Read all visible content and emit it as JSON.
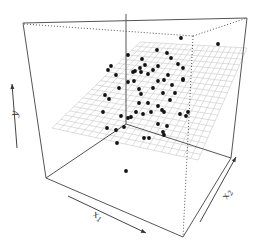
{
  "chart_data": {
    "type": "scatter",
    "subtype": "3d-scatter-with-regression-plane",
    "title": "",
    "xlabel": "x1",
    "ylabel": "y",
    "zlabel": "x2",
    "axis_labels": [
      {
        "base": "x",
        "sub": "1",
        "x": 92,
        "y": 216,
        "rotate": 28
      },
      {
        "base": "y",
        "sub": "",
        "x": 17,
        "y": 117,
        "rotate": -80
      },
      {
        "base": "x",
        "sub": "2",
        "x": 227,
        "y": 200,
        "rotate": -62
      }
    ],
    "grid": true,
    "box_color": "#555555",
    "grid_color": "#c8c8c8",
    "point_color": "#111111",
    "box": {
      "solid_lines": [
        [
          23,
          23,
          247,
          18
        ],
        [
          23,
          23,
          46,
          178
        ],
        [
          247,
          18,
          231,
          158
        ],
        [
          126,
          14,
          126,
          124
        ],
        [
          126,
          124,
          46,
          178
        ],
        [
          126,
          124,
          231,
          158
        ],
        [
          46,
          178,
          183,
          237
        ],
        [
          183,
          237,
          231,
          158
        ]
      ],
      "dotted_lines": [
        [
          24,
          24,
          193,
          36
        ],
        [
          193,
          36,
          247,
          18
        ],
        [
          193,
          36,
          183,
          237
        ]
      ]
    },
    "plane": {
      "corners": [
        [
          52,
          128
        ],
        [
          140,
          42
        ],
        [
          247,
          48
        ],
        [
          214,
          140
        ],
        [
          140,
          170
        ]
      ],
      "grid_quad": [
        [
          52,
          128
        ],
        [
          140,
          42
        ],
        [
          247,
          48
        ],
        [
          198,
          160
        ]
      ],
      "divisions": 20
    },
    "arrows": [
      {
        "name": "y-axis-arrow",
        "x1": 17,
        "y1": 148,
        "x2": 12,
        "y2": 84
      },
      {
        "name": "x1-axis-arrow",
        "x1": 68,
        "y1": 196,
        "x2": 146,
        "y2": 233
      },
      {
        "name": "x2-axis-arrow",
        "x1": 200,
        "y1": 222,
        "x2": 236,
        "y2": 157
      }
    ],
    "points": [
      [
        181,
        38
      ],
      [
        218,
        44
      ],
      [
        157,
        50
      ],
      [
        167,
        53
      ],
      [
        171,
        58
      ],
      [
        128,
        55
      ],
      [
        142,
        59
      ],
      [
        178,
        64
      ],
      [
        145,
        65
      ],
      [
        158,
        66
      ],
      [
        111,
        66
      ],
      [
        135,
        71
      ],
      [
        141,
        72
      ],
      [
        140,
        68
      ],
      [
        148,
        74
      ],
      [
        133,
        72
      ],
      [
        116,
        75
      ],
      [
        183,
        68
      ],
      [
        153,
        70
      ],
      [
        164,
        80
      ],
      [
        134,
        81
      ],
      [
        168,
        75
      ],
      [
        128,
        82
      ],
      [
        183,
        79
      ],
      [
        158,
        81
      ],
      [
        172,
        85
      ],
      [
        119,
        88
      ],
      [
        139,
        89
      ],
      [
        153,
        88
      ],
      [
        141,
        94
      ],
      [
        163,
        93
      ],
      [
        183,
        80
      ],
      [
        139,
        103
      ],
      [
        148,
        103
      ],
      [
        175,
        93
      ],
      [
        170,
        100
      ],
      [
        158,
        106
      ],
      [
        151,
        112
      ],
      [
        136,
        112
      ],
      [
        131,
        117
      ],
      [
        128,
        118
      ],
      [
        180,
        114
      ],
      [
        186,
        116
      ],
      [
        143,
        114
      ],
      [
        162,
        110
      ],
      [
        164,
        112
      ],
      [
        103,
        112
      ],
      [
        188,
        112
      ],
      [
        158,
        124
      ],
      [
        167,
        126
      ],
      [
        124,
        127
      ],
      [
        164,
        135
      ],
      [
        117,
        143
      ],
      [
        144,
        138
      ],
      [
        149,
        138
      ],
      [
        163,
        132
      ],
      [
        121,
        116
      ],
      [
        105,
        95
      ],
      [
        108,
        70
      ],
      [
        126,
        171
      ],
      [
        109,
        99
      ],
      [
        107,
        128
      ],
      [
        116,
        130
      ]
    ],
    "point_radius": 1.9
  }
}
